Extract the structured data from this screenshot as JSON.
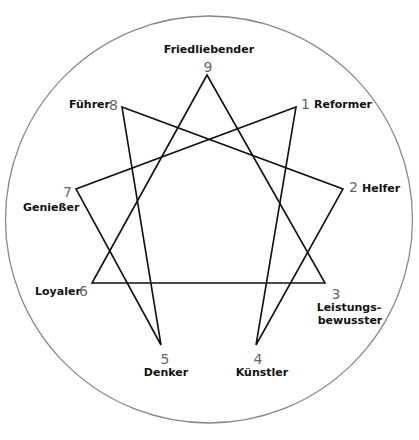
{
  "diagram": {
    "type": "enneagram",
    "circle": {
      "cx": 209,
      "cy": 219.5,
      "r": 203.5,
      "stroke": "#888888"
    },
    "line_color": "#111111",
    "points": [
      {
        "num": "1",
        "name": "Reformer",
        "x": 296,
        "y": 107
      },
      {
        "num": "2",
        "name": "Helfer",
        "x": 343,
        "y": 189
      },
      {
        "num": "3",
        "name": "Leistungs-",
        "name2": "bewusster",
        "x": 325,
        "y": 283
      },
      {
        "num": "4",
        "name": "Künstler",
        "x": 256,
        "y": 345
      },
      {
        "num": "5",
        "name": "Denker",
        "x": 161,
        "y": 345
      },
      {
        "num": "6",
        "name": "Loyaler",
        "x": 92,
        "y": 283
      },
      {
        "num": "7",
        "name": "Genießer",
        "x": 76,
        "y": 189
      },
      {
        "num": "8",
        "name": "Führer",
        "x": 122,
        "y": 107
      },
      {
        "num": "9",
        "name": "Friedliebender",
        "x": 207,
        "y": 75
      }
    ],
    "triangle": [
      "9",
      "3",
      "6"
    ],
    "hexad": [
      "1",
      "4",
      "2",
      "8",
      "5",
      "7"
    ]
  }
}
